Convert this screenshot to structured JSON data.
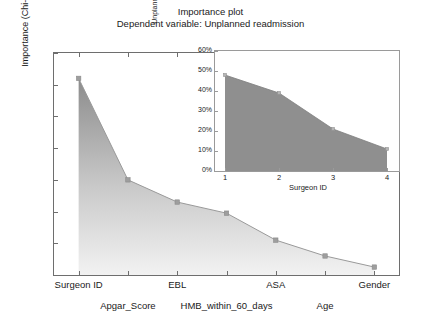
{
  "title": {
    "line1": "Importance plot",
    "line2": "Dependent variable: Unplanned readmission"
  },
  "chart_data": [
    {
      "type": "area",
      "id": "main",
      "title": "Importance plot",
      "subtitle": "Dependent variable: Unplanned readmission",
      "xlabel": "",
      "ylabel": "Importance (Chi-square)",
      "categories": [
        "Surgeon ID",
        "Apgar_Score",
        "EBL",
        "HMB_within_60_days",
        "ASA",
        "Age",
        "Gender"
      ],
      "values": [
        124,
        60,
        46,
        39,
        22,
        12,
        5
      ],
      "ylim": [
        0,
        140
      ],
      "yticks": [
        0,
        20,
        40,
        60,
        80,
        100,
        120,
        140
      ],
      "ytick_labels": [
        "0",
        "20",
        "40",
        "60",
        "80",
        "100",
        "120",
        "140"
      ],
      "grid": false,
      "legend": "none",
      "marker": "square",
      "line_color": "#9a9a9a",
      "fill_top_color": "#8c8c8c",
      "fill_bottom_color": "#f2f2f2"
    },
    {
      "type": "area",
      "id": "inset",
      "title": "",
      "xlabel": "Surgeon ID",
      "ylabel": "Unplanned readmission",
      "x": [
        1,
        2,
        3,
        4
      ],
      "xtick_labels": [
        "1",
        "2",
        "3",
        "4"
      ],
      "values": [
        48,
        39,
        21,
        11
      ],
      "value_labels": [
        "48%",
        "39%",
        "21%",
        "11%"
      ],
      "ylim": [
        0,
        60
      ],
      "yticks": [
        0,
        10,
        20,
        30,
        40,
        50,
        60
      ],
      "ytick_labels": [
        "0%",
        "10%",
        "20%",
        "30%",
        "40%",
        "50%",
        "60%"
      ],
      "grid": false,
      "legend": "none",
      "fill_color": "#8f8f8f",
      "line_color": "#8f8f8f"
    }
  ],
  "colors": {
    "axis": "#6e6e6e",
    "inset_axis": "#9a9a9a",
    "text": "#1a1a1a",
    "series_fill_top": "#8c8c8c",
    "series_fill_bottom": "#f2f2f2",
    "series_line": "#9a9a9a",
    "inset_fill": "#8f8f8f",
    "background": "#ffffff"
  }
}
